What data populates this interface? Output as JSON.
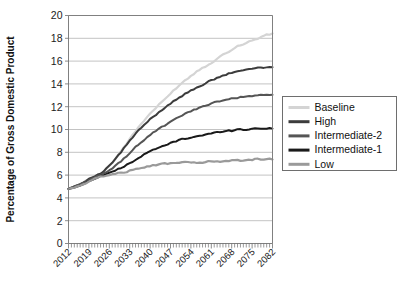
{
  "chart_data": {
    "type": "line",
    "title": "",
    "xlabel": "",
    "ylabel": "Percentage of Gross Domestic Product",
    "xlim": [
      2012,
      2082
    ],
    "ylim": [
      0,
      20
    ],
    "ytick_step": 2,
    "yticks": [
      "0",
      "2",
      "4",
      "6",
      "8",
      "10",
      "12",
      "14",
      "16",
      "18",
      "20"
    ],
    "xticks": [
      "2012",
      "2019",
      "2026",
      "2033",
      "2040",
      "2047",
      "2054",
      "2061",
      "2068",
      "2075",
      "2082"
    ],
    "xtick_step_years": 7,
    "grid": "horizontal",
    "legend_position": "right",
    "x": [
      2012,
      2014,
      2016,
      2018,
      2020,
      2022,
      2024,
      2026,
      2028,
      2030,
      2032,
      2034,
      2036,
      2038,
      2040,
      2042,
      2044,
      2046,
      2048,
      2050,
      2052,
      2054,
      2056,
      2058,
      2060,
      2062,
      2064,
      2066,
      2068,
      2070,
      2072,
      2074,
      2076,
      2078,
      2080,
      2082
    ],
    "series": [
      {
        "name": "Baseline",
        "color": "#d4d4d4",
        "width": 2.2,
        "values": [
          4.8,
          5.0,
          5.2,
          5.5,
          5.8,
          6.0,
          6.3,
          6.8,
          7.4,
          8.1,
          8.8,
          9.5,
          10.2,
          10.8,
          11.4,
          11.9,
          12.4,
          12.9,
          13.4,
          13.9,
          14.3,
          14.7,
          15.1,
          15.4,
          15.7,
          16.0,
          16.4,
          16.7,
          17.0,
          17.3,
          17.5,
          17.7,
          17.9,
          18.1,
          18.3,
          18.4
        ]
      },
      {
        "name": "High",
        "color": "#3c3c3c",
        "width": 2.0,
        "values": [
          4.8,
          5.0,
          5.2,
          5.5,
          5.8,
          6.0,
          6.3,
          6.8,
          7.4,
          8.0,
          8.7,
          9.3,
          9.9,
          10.4,
          10.9,
          11.3,
          11.7,
          12.1,
          12.5,
          12.8,
          13.1,
          13.4,
          13.7,
          13.9,
          14.2,
          14.4,
          14.6,
          14.8,
          15.0,
          15.1,
          15.2,
          15.3,
          15.4,
          15.4,
          15.5,
          15.5
        ]
      },
      {
        "name": "Intermediate-2",
        "color": "#555555",
        "width": 2.0,
        "values": [
          4.8,
          5.0,
          5.2,
          5.4,
          5.7,
          5.9,
          6.1,
          6.4,
          6.8,
          7.2,
          7.7,
          8.2,
          8.7,
          9.1,
          9.5,
          9.9,
          10.2,
          10.5,
          10.8,
          11.1,
          11.4,
          11.6,
          11.8,
          12.0,
          12.2,
          12.4,
          12.5,
          12.6,
          12.7,
          12.8,
          12.9,
          12.9,
          13.0,
          13.0,
          13.0,
          13.0
        ]
      },
      {
        "name": "Intermediate-1",
        "color": "#1a1a1a",
        "width": 2.0,
        "values": [
          4.8,
          4.9,
          5.1,
          5.3,
          5.6,
          5.8,
          6.0,
          6.2,
          6.4,
          6.6,
          6.9,
          7.2,
          7.5,
          7.8,
          8.1,
          8.3,
          8.5,
          8.7,
          8.9,
          9.1,
          9.2,
          9.3,
          9.4,
          9.5,
          9.6,
          9.7,
          9.8,
          9.9,
          9.9,
          10.0,
          10.0,
          10.0,
          10.1,
          10.1,
          10.1,
          10.1
        ]
      },
      {
        "name": "Low",
        "color": "#9a9a9a",
        "width": 2.2,
        "values": [
          4.8,
          4.9,
          5.1,
          5.3,
          5.6,
          5.8,
          5.9,
          6.0,
          6.1,
          6.2,
          6.3,
          6.5,
          6.6,
          6.7,
          6.8,
          6.9,
          7.0,
          7.0,
          7.1,
          7.1,
          7.1,
          7.1,
          7.1,
          7.1,
          7.2,
          7.2,
          7.2,
          7.2,
          7.3,
          7.3,
          7.3,
          7.3,
          7.4,
          7.4,
          7.4,
          7.4
        ]
      }
    ]
  },
  "legend": {
    "items": [
      {
        "label": "Baseline",
        "color": "#d4d4d4"
      },
      {
        "label": "High",
        "color": "#3c3c3c"
      },
      {
        "label": "Intermediate-2",
        "color": "#555555"
      },
      {
        "label": "Intermediate-1",
        "color": "#1a1a1a"
      },
      {
        "label": "Low",
        "color": "#9a9a9a"
      }
    ]
  }
}
